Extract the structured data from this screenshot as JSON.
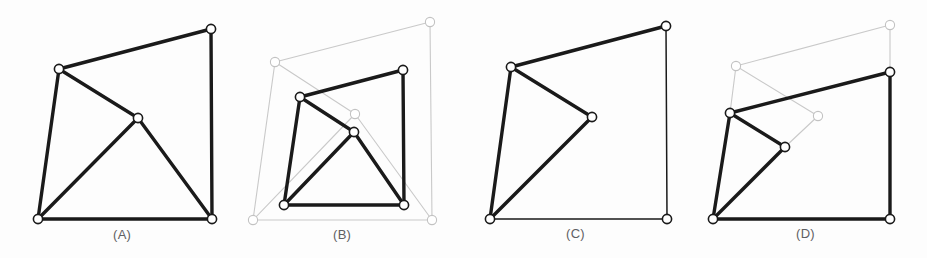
{
  "figure": {
    "background_color": "#fdfdfd",
    "edge_color_active": "#1a1a1a",
    "edge_color_ghost": "#c9c9c9",
    "node_fill": "#ffffff",
    "node_stroke": "#1a1a1a",
    "node_stroke_ghost": "#c2c2c2",
    "node_radius": 4.6
  },
  "panels": [
    {
      "id": "A",
      "label": "(A)",
      "caption_color": "#5f6063",
      "nodes": [
        {
          "name": "top-left",
          "x": 59,
          "y": 69,
          "style": "active"
        },
        {
          "name": "top-right",
          "x": 211,
          "y": 29,
          "style": "active"
        },
        {
          "name": "interior",
          "x": 138,
          "y": 118,
          "style": "active"
        },
        {
          "name": "bottom-left",
          "x": 38,
          "y": 219,
          "style": "active"
        },
        {
          "name": "bottom-right",
          "x": 212,
          "y": 219,
          "style": "active"
        }
      ],
      "edges": [
        {
          "from": 0,
          "to": 1,
          "style": "active"
        },
        {
          "from": 1,
          "to": 4,
          "style": "active"
        },
        {
          "from": 4,
          "to": 3,
          "style": "active"
        },
        {
          "from": 3,
          "to": 0,
          "style": "active"
        },
        {
          "from": 0,
          "to": 2,
          "style": "active"
        },
        {
          "from": 2,
          "to": 3,
          "style": "active"
        },
        {
          "from": 2,
          "to": 4,
          "style": "active"
        }
      ]
    },
    {
      "id": "B",
      "label": "(B)",
      "caption_color": "#5f6063",
      "nodes": [
        {
          "name": "ghost-top-left",
          "x": 275,
          "y": 62,
          "style": "ghost"
        },
        {
          "name": "ghost-top-right",
          "x": 430,
          "y": 22,
          "style": "ghost"
        },
        {
          "name": "ghost-interior",
          "x": 355,
          "y": 114,
          "style": "ghost"
        },
        {
          "name": "ghost-bottom-left",
          "x": 253,
          "y": 220,
          "style": "ghost"
        },
        {
          "name": "ghost-bottom-right",
          "x": 432,
          "y": 220,
          "style": "ghost"
        },
        {
          "name": "top-left",
          "x": 300,
          "y": 97,
          "style": "active"
        },
        {
          "name": "top-right",
          "x": 403,
          "y": 70,
          "style": "active"
        },
        {
          "name": "interior",
          "x": 354,
          "y": 132,
          "style": "active"
        },
        {
          "name": "bottom-left",
          "x": 284,
          "y": 205,
          "style": "active"
        },
        {
          "name": "bottom-right",
          "x": 404,
          "y": 205,
          "style": "active"
        }
      ],
      "edges": [
        {
          "from": 0,
          "to": 1,
          "style": "ghost"
        },
        {
          "from": 1,
          "to": 4,
          "style": "ghost"
        },
        {
          "from": 4,
          "to": 3,
          "style": "ghost"
        },
        {
          "from": 3,
          "to": 0,
          "style": "ghost"
        },
        {
          "from": 0,
          "to": 2,
          "style": "ghost"
        },
        {
          "from": 2,
          "to": 3,
          "style": "ghost"
        },
        {
          "from": 2,
          "to": 4,
          "style": "ghost"
        },
        {
          "from": 5,
          "to": 6,
          "style": "active"
        },
        {
          "from": 6,
          "to": 9,
          "style": "active"
        },
        {
          "from": 9,
          "to": 8,
          "style": "active"
        },
        {
          "from": 8,
          "to": 5,
          "style": "active"
        },
        {
          "from": 5,
          "to": 7,
          "style": "active"
        },
        {
          "from": 7,
          "to": 8,
          "style": "active"
        },
        {
          "from": 7,
          "to": 9,
          "style": "active"
        }
      ]
    },
    {
      "id": "C",
      "label": "(C)",
      "caption_color": "#5f6063",
      "nodes": [
        {
          "name": "top-left",
          "x": 511,
          "y": 67,
          "style": "active"
        },
        {
          "name": "top-right",
          "x": 666,
          "y": 26,
          "style": "active"
        },
        {
          "name": "interior",
          "x": 592,
          "y": 117,
          "style": "active"
        },
        {
          "name": "bottom-left",
          "x": 490,
          "y": 219,
          "style": "active"
        },
        {
          "name": "bottom-right",
          "x": 667,
          "y": 219,
          "style": "active"
        }
      ],
      "edges": [
        {
          "from": 0,
          "to": 1,
          "style": "active"
        },
        {
          "from": 1,
          "to": 4,
          "style": "thin"
        },
        {
          "from": 4,
          "to": 3,
          "style": "thin"
        },
        {
          "from": 3,
          "to": 0,
          "style": "active"
        },
        {
          "from": 0,
          "to": 2,
          "style": "active"
        },
        {
          "from": 2,
          "to": 3,
          "style": "active"
        }
      ]
    },
    {
      "id": "D",
      "label": "(D)",
      "caption_color": "#5f6063",
      "nodes": [
        {
          "name": "ghost-top-left",
          "x": 736,
          "y": 66,
          "style": "ghost"
        },
        {
          "name": "ghost-top-right",
          "x": 890,
          "y": 25,
          "style": "ghost"
        },
        {
          "name": "ghost-interior",
          "x": 818,
          "y": 116,
          "style": "ghost"
        },
        {
          "name": "bottom-left",
          "x": 713,
          "y": 219,
          "style": "active"
        },
        {
          "name": "bottom-right",
          "x": 890,
          "y": 219,
          "style": "active"
        },
        {
          "name": "top-left",
          "x": 730,
          "y": 113,
          "style": "active"
        },
        {
          "name": "top-right",
          "x": 890,
          "y": 72,
          "style": "active"
        },
        {
          "name": "interior",
          "x": 785,
          "y": 147,
          "style": "active"
        }
      ],
      "edges": [
        {
          "from": 0,
          "to": 1,
          "style": "ghost"
        },
        {
          "from": 1,
          "to": 6,
          "style": "ghost"
        },
        {
          "from": 0,
          "to": 5,
          "style": "ghost"
        },
        {
          "from": 0,
          "to": 2,
          "style": "ghost"
        },
        {
          "from": 2,
          "to": 7,
          "style": "ghost"
        },
        {
          "from": 5,
          "to": 6,
          "style": "active"
        },
        {
          "from": 6,
          "to": 4,
          "style": "active"
        },
        {
          "from": 4,
          "to": 3,
          "style": "active"
        },
        {
          "from": 3,
          "to": 5,
          "style": "active"
        },
        {
          "from": 5,
          "to": 7,
          "style": "active"
        },
        {
          "from": 7,
          "to": 3,
          "style": "active"
        }
      ]
    }
  ]
}
